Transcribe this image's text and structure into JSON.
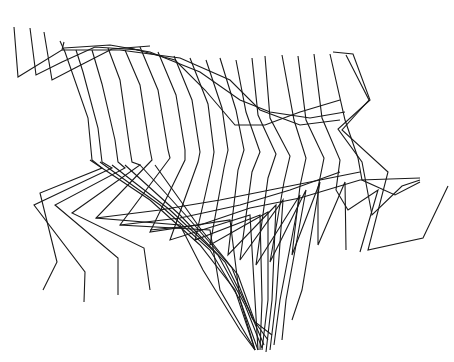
{
  "canvas": {
    "width": 454,
    "height": 362,
    "background": "#ffffff"
  },
  "style": {
    "stroke": "#1a1a1a",
    "stroke_width": 1.1
  },
  "figure": {
    "frames": [
      {
        "id": "f1",
        "points": "14,27 18,77 62,50 64,42"
      },
      {
        "id": "f2",
        "points": "30,28 36,75 62,62 95,47 140,50"
      },
      {
        "id": "f3",
        "points": "44,32 52,80 75,68 112,49 150,46"
      },
      {
        "id": "f4",
        "points": "60,41 65,52 88,118 92,160 102,168 40,193 57,262 43,290"
      },
      {
        "id": "f5",
        "points": "76,50 83,72 98,128 102,162 112,168 34,205 85,272 84,302"
      },
      {
        "id": "f6",
        "points": "92,50 102,84 115,140 118,162 125,168 55,205 118,258 118,295"
      },
      {
        "id": "f7",
        "points": "108,48 120,80 130,150 132,162 140,165 72,213 144,248 150,290"
      },
      {
        "id": "f8",
        "points": "125,50 140,85 150,150 152,160 96,218 180,225 203,270 240,330 255,350"
      },
      {
        "id": "f9",
        "points": "140,47 158,90 168,150 170,158 120,225 210,230 220,290 255,350"
      },
      {
        "id": "f10",
        "points": "158,52 176,95 185,150 185,160 150,232 230,220 240,300 255,350"
      },
      {
        "id": "f11",
        "points": "174,56 192,100 200,152 198,162 170,240 250,215 255,300 258,350"
      },
      {
        "id": "f12",
        "points": "190,58 208,104 214,152 212,165 195,240 260,215 262,300 260,350"
      },
      {
        "id": "f13",
        "points": "206,60 222,108 228,150 224,168 210,245 268,212 268,300 262,350"
      },
      {
        "id": "f14",
        "points": "220,58 236,110 244,150 238,170 228,255 276,205 272,300 266,352"
      },
      {
        "id": "f15",
        "points": "236,60 246,112 260,152 252,172 240,260 283,200 276,300 270,350"
      },
      {
        "id": "f16",
        "points": "252,58 258,115 276,154 268,178 256,265 300,195 280,300 274,345"
      },
      {
        "id": "f17",
        "points": "265,56 270,118 290,156 284,182 270,262 306,190 286,300 282,340"
      },
      {
        "id": "f18",
        "points": "282,55 294,120 306,158 300,186 292,255 320,182 302,290 292,320"
      },
      {
        "id": "f19",
        "points": "298,56 306,120 324,158 318,188 318,245 345,182 346,250"
      },
      {
        "id": "f20",
        "points": "314,54 322,118 340,160 336,190 348,210 378,190 360,252"
      },
      {
        "id": "f21",
        "points": "333,52 353,54 370,100 338,129 362,162 372,215 402,186 420,180"
      },
      {
        "id": "f22",
        "points": "330,54 345,120 358,158 362,180 395,195 420,182"
      },
      {
        "id": "f23",
        "points": "346,55 369,100 342,130 388,172 368,250 423,238 448,186"
      }
    ],
    "upper_arcs": [
      {
        "id": "a1",
        "points": "62,50 120,50 180,58 230,80 260,110 300,125 340,120"
      },
      {
        "id": "a2",
        "points": "64,48 110,45 150,52 200,72 240,100 270,112 310,118 345,112"
      },
      {
        "id": "a3",
        "points": "130,48 175,60 205,90 235,125 265,125 300,112 340,100"
      }
    ],
    "mid_bands": [
      {
        "id": "m1",
        "points": "96,218 160,210 220,200 270,190 320,180 360,172"
      },
      {
        "id": "m2",
        "points": "120,225 180,218 240,205 290,190 340,172"
      },
      {
        "id": "m3",
        "points": "150,230 200,225 250,208 300,198 360,180 420,178"
      }
    ],
    "leg_fan": [
      {
        "id": "l1",
        "points": "90,160 150,200 200,245 235,290 255,350"
      },
      {
        "id": "l2",
        "points": "100,162 160,205 210,250 240,300 258,350"
      },
      {
        "id": "l3",
        "points": "112,165 170,210 218,255 245,305 262,348"
      },
      {
        "id": "l4",
        "points": "125,165 180,215 225,262 250,312 264,345"
      },
      {
        "id": "l5",
        "points": "140,165 190,220 232,268 252,318 268,340"
      },
      {
        "id": "l6",
        "points": "155,165 200,228 238,275 255,322 272,335"
      }
    ]
  }
}
